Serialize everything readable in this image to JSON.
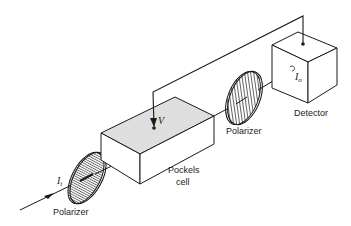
{
  "diagram": {
    "components": {
      "input_polarizer": {
        "label": "Polarizer"
      },
      "pockels_cell": {
        "label_line1": "Pockels",
        "label_line2": "cell",
        "voltage_label": "V"
      },
      "output_polarizer": {
        "label": "Polarizer"
      },
      "detector": {
        "label": "Detector"
      }
    },
    "beam": {
      "input_intensity": {
        "symbol": "I",
        "subscript": "i"
      },
      "output_intensity": {
        "symbol": "I",
        "subscript": "o"
      }
    },
    "colors": {
      "line": "#1a1a1a",
      "shaded_face": "#d9d9d9",
      "background": "#ffffff"
    }
  }
}
